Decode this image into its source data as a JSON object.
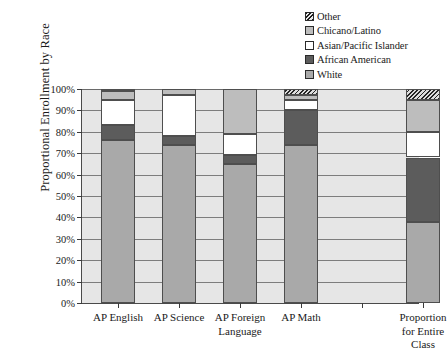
{
  "chart_data": {
    "type": "bar",
    "subtype": "stacked-100-percent",
    "title": "",
    "xlabel": "",
    "ylabel": "Proportional Enrollment by Race",
    "ylim": [
      0,
      100
    ],
    "ytick_labels": [
      "0%",
      "10%",
      "20%",
      "30%",
      "40%",
      "50%",
      "60%",
      "70%",
      "80%",
      "90%",
      "100%"
    ],
    "ytick_values": [
      0,
      10,
      20,
      30,
      40,
      50,
      60,
      70,
      80,
      90,
      100
    ],
    "grid": "horizontal",
    "legend_position": "top-right",
    "categories": [
      "AP English",
      "AP Science",
      "AP Foreign\nLanguage",
      "AP Math",
      "Proportion\nfor Entire Class"
    ],
    "series": [
      {
        "name": "White",
        "color": "#a9a9a9",
        "values": [
          76,
          74,
          65,
          74,
          38
        ]
      },
      {
        "name": "African American",
        "color": "#5c5c5c",
        "values": [
          7,
          4,
          4,
          16,
          30
        ]
      },
      {
        "name": "Asian/Pacific Islander",
        "color": "#ffffff",
        "values": [
          12,
          19,
          10,
          5,
          12
        ]
      },
      {
        "name": "Chicano/Latino",
        "color": "#bdbdbd",
        "values": [
          4,
          3,
          21,
          2,
          15
        ]
      },
      {
        "name": "Other",
        "color": "#9a9a9a",
        "pattern": "diagonal-hatch",
        "values": [
          1,
          0,
          0,
          3,
          5
        ]
      }
    ]
  },
  "legend": {
    "items": [
      {
        "label": "Other",
        "swatch": "other"
      },
      {
        "label": "Chicano/Latino",
        "swatch": "chicano"
      },
      {
        "label": "Asian/Pacific Islander",
        "swatch": "asian"
      },
      {
        "label": "African American",
        "swatch": "african"
      },
      {
        "label": "White",
        "swatch": "white"
      }
    ]
  }
}
